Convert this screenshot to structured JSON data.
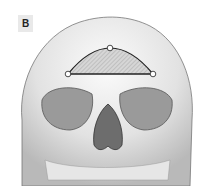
{
  "figure": {
    "panel_label": "B",
    "overlay": {
      "shape": "hatched semicircle on frontal bone",
      "points": [
        {
          "name": "left",
          "x": 68,
          "y": 74
        },
        {
          "name": "apex",
          "x": 110,
          "y": 48
        },
        {
          "name": "right",
          "x": 153,
          "y": 74
        }
      ]
    },
    "colors": {
      "bone_light": "#f2f2f2",
      "bone_shade": "#bdbdbd",
      "outline": "#333333",
      "label_bg": "#e9e9e9"
    }
  }
}
